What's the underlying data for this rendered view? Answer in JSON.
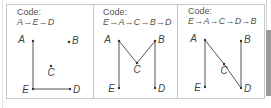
{
  "panels": [
    {
      "code_label": "Code:",
      "code_sequence": "A→E→D",
      "points": {
        "A": {
          "x": 33,
          "y": 41
        },
        "B": {
          "x": 69,
          "y": 42
        },
        "C": {
          "x": 51,
          "y": 66
        },
        "D": {
          "x": 70,
          "y": 89
        },
        "E": {
          "x": 33,
          "y": 89
        }
      },
      "path": [
        "A",
        "E",
        "D"
      ]
    },
    {
      "code_label": "Code:",
      "code_sequence": "E→A→C→B→D",
      "points": {
        "A": {
          "x": 119,
          "y": 41
        },
        "B": {
          "x": 155,
          "y": 41
        },
        "C": {
          "x": 137,
          "y": 63
        },
        "D": {
          "x": 155,
          "y": 88
        },
        "E": {
          "x": 119,
          "y": 88
        }
      },
      "path": [
        "E",
        "A",
        "C",
        "B",
        "D"
      ]
    },
    {
      "code_label": "Code:",
      "code_sequence": "E→A→C→D→B",
      "points": {
        "A": {
          "x": 205,
          "y": 40
        },
        "B": {
          "x": 241,
          "y": 41
        },
        "C": {
          "x": 224,
          "y": 64
        },
        "D": {
          "x": 241,
          "y": 88
        },
        "E": {
          "x": 205,
          "y": 87
        }
      },
      "path": [
        "E",
        "A",
        "C",
        "D",
        "B"
      ]
    }
  ],
  "labels": {
    "A": "A",
    "B": "B",
    "C": "C",
    "D": "D",
    "E": "E"
  },
  "colors": {
    "line": "#555555",
    "border": "#c8c8c8",
    "text": "#555555"
  }
}
